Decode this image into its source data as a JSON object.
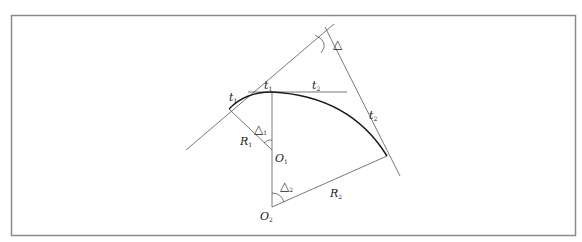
{
  "diagram": {
    "labels": {
      "delta": "△",
      "delta1": {
        "main": "△",
        "sub": "1"
      },
      "delta2": {
        "main": "△",
        "sub": "2"
      },
      "t1_left": {
        "main": "t",
        "sub": "1"
      },
      "t1_top": {
        "main": "t",
        "sub": "1"
      },
      "t2_top": {
        "main": "t",
        "sub": "2"
      },
      "t2_right": {
        "main": "t",
        "sub": "2"
      },
      "R1": {
        "main": "R",
        "sub": "1"
      },
      "R2": {
        "main": "R",
        "sub": "2"
      },
      "O1": {
        "main": "O",
        "sub": "1"
      },
      "O2": {
        "main": "O",
        "sub": "2"
      }
    },
    "colors": {
      "frame": "#8a8a8a",
      "line": "#555555",
      "curve": "#1a1a1a"
    }
  }
}
